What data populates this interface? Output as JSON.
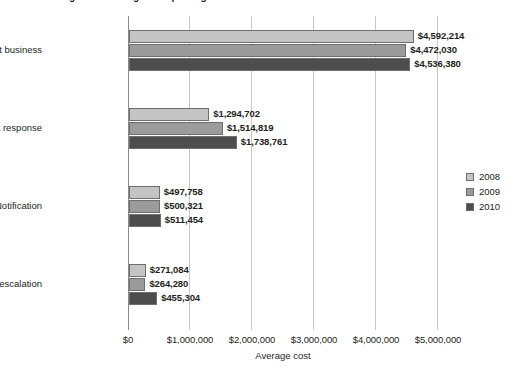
{
  "chart_data": {
    "type": "bar",
    "orientation": "horizontal",
    "title": "Figure 8. Average cost per organization",
    "xlabel": "Average cost",
    "ylabel": "",
    "xlim": [
      0,
      5000000
    ],
    "xticks": [
      "$0",
      "$1,000,000",
      "$2,000,000",
      "$3,000,000",
      "$4,000,000",
      "$5,000,000"
    ],
    "xtick_values": [
      0,
      1000000,
      2000000,
      3000000,
      4000000,
      5000000
    ],
    "grid": true,
    "legend_position": "right",
    "categories": [
      "Lost business",
      "Ex-post response",
      "Notification",
      "Detection and escalation"
    ],
    "series": [
      {
        "name": "2008",
        "color": "#c4c4c4",
        "values": [
          4592214,
          1294702,
          497758,
          271084
        ],
        "labels": [
          "$4,592,214",
          "$1,294,702",
          "$497,758",
          "$271,084"
        ]
      },
      {
        "name": "2009",
        "color": "#9b9b9b",
        "values": [
          4472030,
          1514819,
          500321,
          264280
        ],
        "labels": [
          "$4,472,030",
          "$1,514,819",
          "$500,321",
          "$264,280"
        ]
      },
      {
        "name": "2010",
        "color": "#4d4d4d",
        "values": [
          4536380,
          1738761,
          511454,
          455304
        ],
        "labels": [
          "$4,536,380",
          "$1,738,761",
          "$511,454",
          "$455,304"
        ]
      }
    ]
  }
}
